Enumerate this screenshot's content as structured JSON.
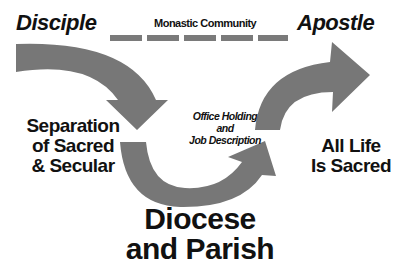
{
  "labels": {
    "disciple": "Disciple",
    "apostle": "Apostle",
    "monastic_community": "Monastic Community",
    "office_holding": [
      "Office Holding",
      "and",
      "Job Description"
    ],
    "separation": [
      "Separation",
      "of Sacred",
      "& Secular"
    ],
    "all_life": [
      "All Life",
      "Is Sacred"
    ],
    "diocese": [
      "Diocese",
      "and Parish"
    ]
  },
  "colors": {
    "arrow": "#777777",
    "text": "#111111"
  }
}
